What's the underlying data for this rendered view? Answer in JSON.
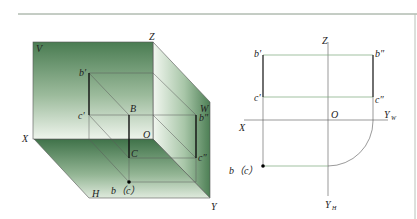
{
  "figure": {
    "left_view": {
      "title": "Three-plane projection system (pictorial)",
      "planes": {
        "V": "V",
        "H": "H",
        "W": "W"
      },
      "axes": {
        "X": "X",
        "Y": "Y",
        "Z": "Z",
        "O": "O"
      },
      "points": {
        "B": "B",
        "C": "C",
        "b_prime": "b′",
        "c_prime": "c′",
        "b_double_prime": "b″",
        "c_double_prime": "c″",
        "b_c": "b（c）"
      }
    },
    "right_view": {
      "title": "Orthographic projection",
      "axes": {
        "X": "X",
        "Z": "Z",
        "O": "O",
        "Y_W": "Y",
        "Y_W_sub": "W",
        "Y_H": "Y",
        "Y_H_sub": "H"
      },
      "points": {
        "b_prime": "b′",
        "c_prime": "c′",
        "b_double_prime": "b″",
        "c_double_prime": "c″",
        "b_c": "b（c）"
      }
    },
    "colors": {
      "plane_dark": "#4a7c52",
      "plane_light": "#eef4ec",
      "line": "#333333",
      "green_line": "#7aa67a",
      "rule": "#8a9a8a"
    }
  }
}
